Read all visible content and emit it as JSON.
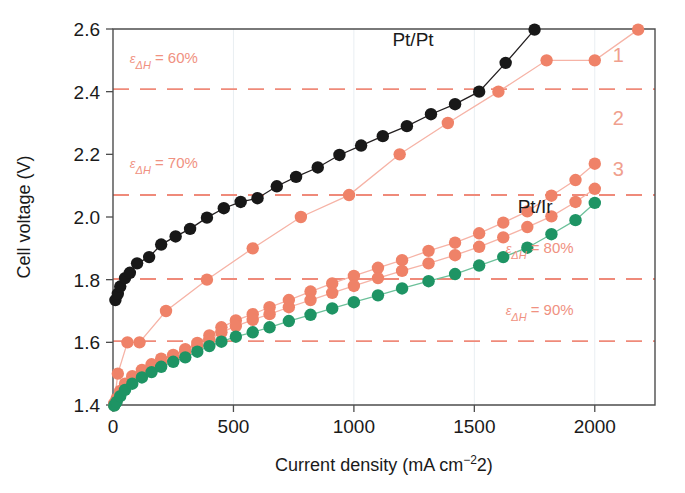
{
  "chart_data": {
    "type": "scatter",
    "title": "",
    "xlabel": "Current density (mA cm−2)",
    "ylabel": "Cell voltage (V)",
    "xlim": [
      0,
      2250
    ],
    "ylim": [
      1.4,
      2.6
    ],
    "xticks": [
      0,
      500,
      1000,
      1500,
      2000
    ],
    "xticklabels": [
      "0",
      "500",
      "1000",
      "1500",
      "2000"
    ],
    "yticks": [
      1.4,
      1.6,
      1.8,
      2.0,
      2.2,
      2.4,
      2.6
    ],
    "yticklabels": [
      "1.4",
      "1.6",
      "1.8",
      "2.0",
      "2.2",
      "2.4",
      "2.6"
    ],
    "grid": false,
    "legend_position": "inline-annotations",
    "reference_lines": [
      {
        "label": "60%",
        "prefix": "ε",
        "subscript": "ΔH",
        "equals": "=",
        "value": 2.408,
        "color": "#ef8a7a",
        "label_x": 70,
        "label_y": 2.49
      },
      {
        "label": "70%",
        "prefix": "ε",
        "subscript": "ΔH",
        "equals": "=",
        "value": 2.07,
        "color": "#ef8a7a",
        "label_x": 70,
        "label_y": 2.155
      },
      {
        "label": "80%",
        "prefix": "ε",
        "subscript": "ΔH",
        "equals": "=",
        "value": 1.802,
        "color": "#ef8a7a",
        "label_x": 1630,
        "label_y": 1.885
      },
      {
        "label": "90%",
        "prefix": "ε",
        "subscript": "ΔH",
        "equals": "=",
        "value": 1.604,
        "color": "#ef8a7a",
        "label_x": 1630,
        "label_y": 1.686
      }
    ],
    "series": [
      {
        "name": "Pt/Pt",
        "color": "#181818",
        "line_color": "#231f20",
        "marker": "circle",
        "marker_size": 6.2,
        "label_x": 1160,
        "label_y": 2.545,
        "label_color": "#1a1a1a",
        "x": [
          10,
          20,
          30,
          50,
          70,
          100,
          150,
          200,
          260,
          320,
          390,
          460,
          530,
          600,
          680,
          760,
          850,
          940,
          1030,
          1120,
          1220,
          1320,
          1420,
          1520,
          1630,
          1750
        ],
        "y": [
          1.735,
          1.755,
          1.778,
          1.805,
          1.822,
          1.852,
          1.872,
          1.912,
          1.938,
          1.962,
          1.998,
          2.028,
          2.048,
          2.06,
          2.098,
          2.128,
          2.158,
          2.198,
          2.228,
          2.258,
          2.29,
          2.328,
          2.36,
          2.4,
          2.492,
          2.598
        ]
      },
      {
        "name": "1",
        "color": "#ef8268",
        "line_color": "#f6b3a6",
        "marker": "circle",
        "marker_size": 6.2,
        "label_x": 2075,
        "label_y": 2.495,
        "label_color": "#f0a08e",
        "x": [
          5,
          20,
          60,
          110,
          220,
          390,
          580,
          780,
          980,
          1190,
          1390,
          1600,
          1800,
          2000,
          2180
        ],
        "y": [
          1.405,
          1.5,
          1.6,
          1.6,
          1.7,
          1.8,
          1.9,
          2.0,
          2.07,
          2.2,
          2.3,
          2.4,
          2.5,
          2.5,
          2.598
        ]
      },
      {
        "name": "2",
        "color": "#ef8268",
        "line_color": "#f6b3a6",
        "marker": "circle",
        "marker_size": 6.2,
        "label_x": 2075,
        "label_y": 2.295,
        "label_color": "#f0a08e",
        "x": [
          5,
          15,
          30,
          50,
          80,
          120,
          160,
          200,
          250,
          300,
          350,
          400,
          450,
          510,
          580,
          650,
          730,
          820,
          910,
          1000,
          1100,
          1200,
          1310,
          1420,
          1520,
          1620,
          1720,
          1820,
          1920,
          2000
        ],
        "y": [
          1.4,
          1.42,
          1.445,
          1.468,
          1.492,
          1.512,
          1.53,
          1.548,
          1.56,
          1.578,
          1.598,
          1.622,
          1.648,
          1.67,
          1.69,
          1.712,
          1.735,
          1.762,
          1.788,
          1.812,
          1.838,
          1.862,
          1.892,
          1.918,
          1.948,
          1.982,
          2.018,
          2.068,
          2.118,
          2.17
        ]
      },
      {
        "name": "3",
        "color": "#ef8268",
        "line_color": "#f6b3a6",
        "marker": "circle",
        "marker_size": 6.2,
        "label_x": 2075,
        "label_y": 2.13,
        "label_color": "#f0a08e",
        "x": [
          5,
          15,
          30,
          50,
          80,
          120,
          160,
          200,
          250,
          300,
          350,
          400,
          450,
          510,
          580,
          650,
          730,
          820,
          910,
          1000,
          1100,
          1200,
          1310,
          1420,
          1520,
          1620,
          1720,
          1820,
          1920,
          2000
        ],
        "y": [
          1.4,
          1.415,
          1.438,
          1.458,
          1.48,
          1.5,
          1.518,
          1.535,
          1.552,
          1.57,
          1.588,
          1.608,
          1.632,
          1.652,
          1.672,
          1.69,
          1.712,
          1.735,
          1.758,
          1.78,
          1.805,
          1.828,
          1.852,
          1.878,
          1.905,
          1.935,
          1.968,
          2.002,
          2.048,
          2.09
        ]
      },
      {
        "name": "Pt/Ir",
        "color": "#1e9464",
        "line_color": "#6cc09a",
        "marker": "circle",
        "marker_size": 6.2,
        "label_x": 1680,
        "label_y": 2.012,
        "label_color": "#1a1a1a",
        "x": [
          5,
          15,
          30,
          50,
          80,
          120,
          160,
          200,
          250,
          300,
          350,
          400,
          450,
          510,
          580,
          650,
          730,
          820,
          910,
          1000,
          1100,
          1200,
          1310,
          1420,
          1520,
          1620,
          1720,
          1820,
          1920,
          2000
        ],
        "y": [
          1.398,
          1.41,
          1.428,
          1.448,
          1.468,
          1.488,
          1.505,
          1.522,
          1.538,
          1.552,
          1.57,
          1.588,
          1.602,
          1.618,
          1.632,
          1.648,
          1.668,
          1.688,
          1.708,
          1.728,
          1.75,
          1.772,
          1.795,
          1.818,
          1.845,
          1.872,
          1.902,
          1.945,
          1.99,
          2.045
        ]
      }
    ]
  }
}
